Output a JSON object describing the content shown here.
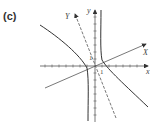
{
  "panel": {
    "label": "(c)"
  },
  "axes": {
    "x_label": "x",
    "y_label": "y",
    "rotated_x_label": "X",
    "rotated_y_label": "Y",
    "tick_label_x": "1",
    "tick_label_y": "1"
  },
  "colors": {
    "axis": "#555555",
    "curve": "#333333",
    "text": "#444444"
  }
}
